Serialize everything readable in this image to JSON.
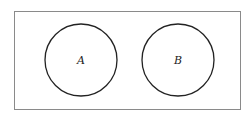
{
  "diagram": {
    "type": "venn",
    "universe": {
      "x": 14,
      "y": 11,
      "width": 226,
      "height": 98,
      "stroke": "#888888"
    },
    "sets": [
      {
        "label": "A",
        "cx": 81,
        "cy": 60,
        "r": 36,
        "stroke": "#222222"
      },
      {
        "label": "B",
        "cx": 178,
        "cy": 60,
        "r": 36,
        "stroke": "#222222"
      }
    ]
  }
}
